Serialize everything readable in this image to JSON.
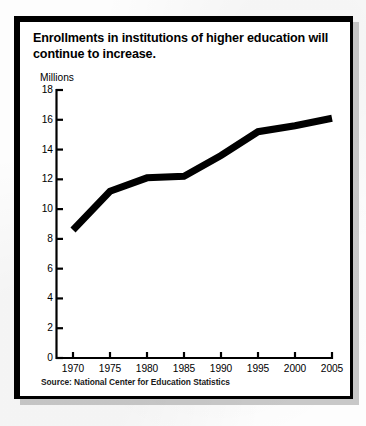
{
  "figure": {
    "title": "Enrollments in institutions of higher education will continue to increase.",
    "unit_label": "Millions",
    "source": "Source:  National Center for Education Statistics",
    "frame_color": "#000000",
    "line_color": "#000000",
    "background_color": "#ffffff"
  },
  "chart_data": {
    "type": "line",
    "title": "Enrollments in institutions of higher education will continue to increase.",
    "subtitle": "",
    "xlabel": "",
    "ylabel": "Millions",
    "x": [
      1970,
      1975,
      1980,
      1985,
      1990,
      1995,
      2000,
      2005
    ],
    "values": [
      8.6,
      11.2,
      12.1,
      12.2,
      13.6,
      15.2,
      15.6,
      16.1
    ],
    "series": [
      {
        "name": "Enrollment",
        "values": [
          8.6,
          11.2,
          12.1,
          12.2,
          13.6,
          15.2,
          15.6,
          16.1
        ]
      }
    ],
    "xtick_labels": [
      "1970",
      "1975",
      "1980",
      "1985",
      "1990",
      "1995",
      "2000",
      "2005"
    ],
    "ytick_labels": [
      "0",
      "2",
      "4",
      "6",
      "8",
      "10",
      "12",
      "14",
      "16",
      "18"
    ],
    "ytick_values": [
      0,
      2,
      4,
      6,
      8,
      10,
      12,
      14,
      16,
      18
    ],
    "xlim": [
      1970,
      2005
    ],
    "ylim": [
      0,
      18
    ],
    "grid": false,
    "legend": false,
    "legend_position": "none",
    "annotations": [],
    "source_note": "Source:  National Center for Education Statistics",
    "line_width_px": 7
  }
}
